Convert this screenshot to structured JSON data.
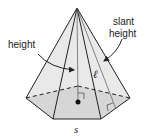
{
  "figure": {
    "labels": {
      "height": "height",
      "slant_line1": "slant",
      "slant_line2": "height",
      "slant_symbol": "ℓ",
      "side": "s"
    },
    "colors": {
      "face": "#e6e6e6",
      "base": "#d9d9d9",
      "stroke": "#222222"
    }
  }
}
